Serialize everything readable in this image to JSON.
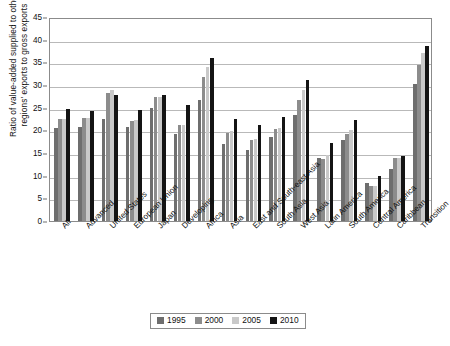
{
  "chart_data": {
    "type": "bar",
    "title": "",
    "xlabel": "",
    "ylabel": "Ratio of value-added supplied to other regions' exports to gross exports",
    "ylabel_line1": "Ratio of value-added supplied to other",
    "ylabel_line2": "regions' exports to gross exports",
    "ylim": [
      0,
      45
    ],
    "ytick_step": 5,
    "yticks": [
      "0",
      "5",
      "10",
      "15",
      "20",
      "25",
      "30",
      "35",
      "40",
      "45"
    ],
    "grid": true,
    "legend_position": "bottom",
    "categories": [
      "All",
      "Advanced",
      "United States",
      "European Union",
      "Japan",
      "Developing",
      "Africa",
      "Asia",
      "East and South-east Asia",
      "South Asia",
      "West Asia",
      "Latin America",
      "South America",
      "Central America",
      "Caribbean",
      "Transition"
    ],
    "series": [
      {
        "name": "1995",
        "color": "#6e6e6e",
        "values": [
          20.5,
          20.8,
          22.6,
          20.7,
          25.0,
          19.3,
          26.7,
          17.0,
          15.6,
          18.6,
          23.3,
          13.9,
          17.9,
          8.4,
          11.5,
          30.3
        ]
      },
      {
        "name": "2000",
        "color": "#8c8c8c",
        "values": [
          22.4,
          22.8,
          28.3,
          22.1,
          27.3,
          21.1,
          31.7,
          19.4,
          17.9,
          20.4,
          26.8,
          13.7,
          19.2,
          7.7,
          13.9,
          34.4
        ]
      },
      {
        "name": "2005",
        "color": "#c9c9c9",
        "values": [
          22.4,
          22.8,
          28.8,
          22.2,
          27.4,
          21.2,
          33.9,
          19.9,
          18.1,
          20.6,
          28.9,
          14.6,
          20.0,
          7.8,
          14.0,
          37.0
        ]
      },
      {
        "name": "2010",
        "color": "#141414",
        "values": [
          24.8,
          24.2,
          27.9,
          24.5,
          27.7,
          25.6,
          35.9,
          22.6,
          21.1,
          23.0,
          31.0,
          17.3,
          22.2,
          9.9,
          14.3,
          38.7
        ]
      }
    ]
  },
  "legend": {
    "entries": [
      "1995",
      "2000",
      "2005",
      "2010"
    ]
  }
}
